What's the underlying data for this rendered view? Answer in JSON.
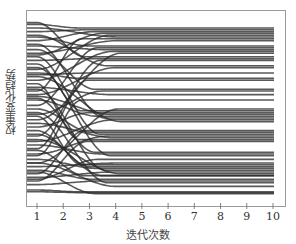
{
  "chart_data": {
    "type": "line",
    "title": "",
    "xlabel": "迭代次数",
    "ylabel": "权重变化趋势",
    "x": [
      1,
      2,
      3,
      4,
      5,
      6,
      7,
      8,
      9,
      10
    ],
    "xticks": [
      "1",
      "2",
      "3",
      "4",
      "5",
      "6",
      "7",
      "8",
      "9",
      "10"
    ],
    "xlim": [
      0.6,
      10.45
    ],
    "ylim": [
      0,
      1
    ],
    "yticks_shown": false,
    "grid": false,
    "legend": "none",
    "line_color": "#2a2a2a",
    "note": "Many weight trajectories start dispersed at iteration 1, cross heavily during iterations 1-3, then converge into fixed horizontal bands from about iteration 4 to 10. Values are normalized (no y tick labels shown).",
    "series": [
      {
        "start": 0.97,
        "end": 0.95
      },
      {
        "start": 0.93,
        "end": 0.94
      },
      {
        "start": 0.88,
        "end": 0.93
      },
      {
        "start": 0.8,
        "end": 0.92
      },
      {
        "start": 0.72,
        "end": 0.91
      },
      {
        "start": 0.95,
        "end": 0.9
      },
      {
        "start": 0.6,
        "end": 0.89
      },
      {
        "start": 0.9,
        "end": 0.85
      },
      {
        "start": 0.52,
        "end": 0.84
      },
      {
        "start": 0.85,
        "end": 0.83
      },
      {
        "start": 0.66,
        "end": 0.82
      },
      {
        "start": 0.44,
        "end": 0.81
      },
      {
        "start": 0.98,
        "end": 0.79
      },
      {
        "start": 0.77,
        "end": 0.78
      },
      {
        "start": 0.35,
        "end": 0.77
      },
      {
        "start": 0.91,
        "end": 0.74
      },
      {
        "start": 0.58,
        "end": 0.73
      },
      {
        "start": 0.7,
        "end": 0.67
      },
      {
        "start": 0.28,
        "end": 0.66
      },
      {
        "start": 0.83,
        "end": 0.61
      },
      {
        "start": 0.47,
        "end": 0.6
      },
      {
        "start": 0.62,
        "end": 0.58
      },
      {
        "start": 0.2,
        "end": 0.5
      },
      {
        "start": 0.75,
        "end": 0.49
      },
      {
        "start": 0.4,
        "end": 0.48
      },
      {
        "start": 0.55,
        "end": 0.46
      },
      {
        "start": 0.86,
        "end": 0.45
      },
      {
        "start": 0.32,
        "end": 0.44
      },
      {
        "start": 0.68,
        "end": 0.43
      },
      {
        "start": 0.14,
        "end": 0.38
      },
      {
        "start": 0.5,
        "end": 0.37
      },
      {
        "start": 0.79,
        "end": 0.36
      },
      {
        "start": 0.25,
        "end": 0.35
      },
      {
        "start": 0.42,
        "end": 0.34
      },
      {
        "start": 0.64,
        "end": 0.33
      },
      {
        "start": 0.1,
        "end": 0.32
      },
      {
        "start": 0.56,
        "end": 0.26
      },
      {
        "start": 0.3,
        "end": 0.25
      },
      {
        "start": 0.73,
        "end": 0.24
      },
      {
        "start": 0.18,
        "end": 0.2
      },
      {
        "start": 0.46,
        "end": 0.19
      },
      {
        "start": 0.38,
        "end": 0.18
      },
      {
        "start": 0.22,
        "end": 0.17
      },
      {
        "start": 0.61,
        "end": 0.16
      },
      {
        "start": 0.12,
        "end": 0.15
      },
      {
        "start": 0.33,
        "end": 0.14
      },
      {
        "start": 0.27,
        "end": 0.13
      },
      {
        "start": 0.16,
        "end": 0.11
      },
      {
        "start": 0.08,
        "end": 0.1
      },
      {
        "start": 0.48,
        "end": 0.09
      },
      {
        "start": 0.2,
        "end": 0.07
      },
      {
        "start": 0.05,
        "end": 0.04
      },
      {
        "start": 0.04,
        "end": 0.035
      },
      {
        "start": 0.15,
        "end": 0.03
      },
      {
        "start": 0.36,
        "end": 0.13
      },
      {
        "start": 0.57,
        "end": 0.47
      },
      {
        "start": 0.81,
        "end": 0.88
      },
      {
        "start": 0.24,
        "end": 0.55
      },
      {
        "start": 0.69,
        "end": 0.7
      },
      {
        "start": 0.11,
        "end": 0.22
      }
    ]
  },
  "plot": {
    "frame_px": {
      "left": 26,
      "top": 10,
      "right": 285,
      "bottom": 206
    },
    "x_px": {
      "min_val": 1,
      "min_px": 37,
      "max_val": 10,
      "max_px": 273
    },
    "y_px": {
      "val0_px": 199,
      "val1_px": 19
    },
    "data_right_px": 273
  }
}
